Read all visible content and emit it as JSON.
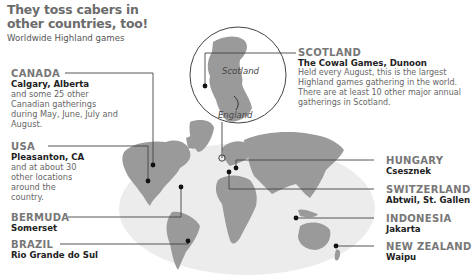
{
  "header": {
    "title": "They toss cabers in other countries, too!",
    "subtitle": "Worldwide Highland games"
  },
  "inset": {
    "labels": [
      "Scotland",
      "England"
    ]
  },
  "locations": [
    {
      "country": "CANADA",
      "place": "Calgary, Alberta",
      "description": "and some 25 other Canadian gatherings during May, June, July and August."
    },
    {
      "country": "USA",
      "place": "Pleasanton, CA",
      "description": "and at about 30 other locations around the country."
    },
    {
      "country": "BERMUDA",
      "place": "Somerset",
      "description": ""
    },
    {
      "country": "BRAZIL",
      "place": "Rio Grande do Sul",
      "description": ""
    },
    {
      "country": "SCOTLAND",
      "place": "The Cowal Games, Dunoon",
      "description": "Held every August, this is the largest Highland games gathering in the world. There are at least 10 other major annual gatherings in Scotland."
    },
    {
      "country": "HUNGARY",
      "place": "Csesznek",
      "description": ""
    },
    {
      "country": "SWITZERLAND",
      "place": "Abtwil, St. Gallen",
      "description": ""
    },
    {
      "country": "INDONESIA",
      "place": "Jakarta",
      "description": ""
    },
    {
      "country": "NEW ZEALAND",
      "place": "Waipu",
      "description": ""
    }
  ],
  "colors": {
    "ocean": "#ececec",
    "land": "#9a9a9a",
    "leader": "#444444",
    "dot": "#111111"
  }
}
